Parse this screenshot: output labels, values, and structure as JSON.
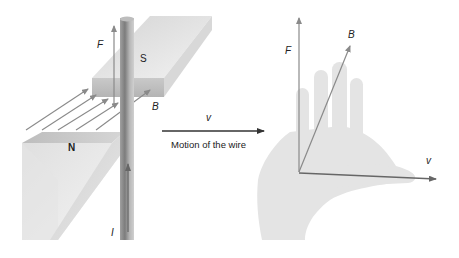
{
  "figure": {
    "left_panel": {
      "magnet_south_label": "S",
      "magnet_north_label": "N",
      "force_label": "F",
      "field_label": "B",
      "current_label": "I"
    },
    "middle": {
      "velocity_label": "v",
      "caption": "Motion of the wire"
    },
    "right_panel": {
      "force_label": "F",
      "field_label": "B",
      "velocity_label": "v"
    },
    "colors": {
      "arrow_gray": "#8a8a8a",
      "arrow_dark": "#333333",
      "magnet_light": "#e2e2e2",
      "magnet_mid": "#c8c8c8",
      "magnet_dark": "#a8a8a8",
      "wire_dark": "#888888",
      "wire_light": "#c4c4c4",
      "hand": "#e4e4e4"
    }
  }
}
